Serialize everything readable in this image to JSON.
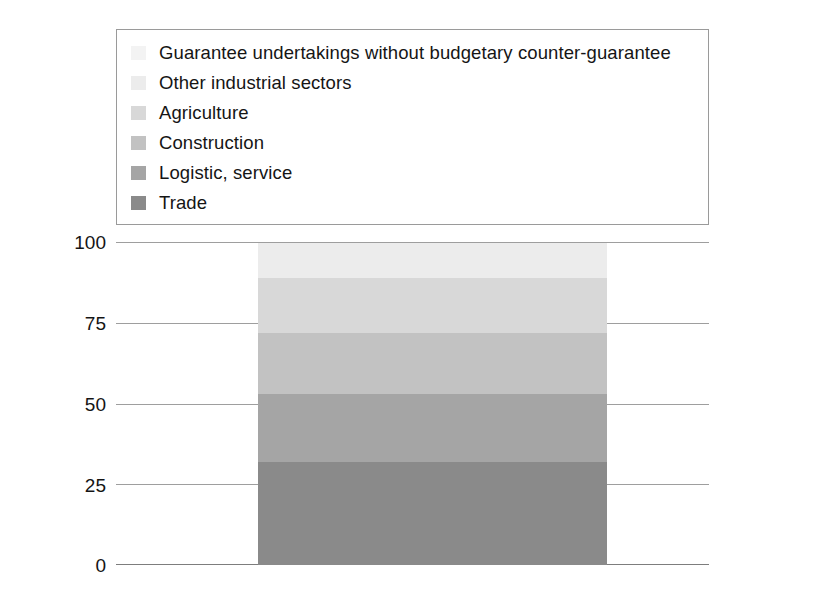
{
  "chart_data": {
    "type": "bar",
    "subtype": "stacked-column-100",
    "title": "",
    "xlabel": "",
    "ylabel": "",
    "ylim": [
      0,
      100
    ],
    "yticks": [
      "0",
      "25",
      "50",
      "75",
      "100"
    ],
    "ytick_values": [
      0,
      25,
      50,
      75,
      100
    ],
    "grid": true,
    "legend_position": "top",
    "categories": [
      ""
    ],
    "series": [
      {
        "name": "Trade",
        "values": [
          32
        ],
        "color": "#8a8a8a",
        "swatch_color": "#8a8a8a"
      },
      {
        "name": "Logistic, service",
        "values": [
          21
        ],
        "color": "#a5a5a5",
        "swatch_color": "#a5a5a5"
      },
      {
        "name": "Construction",
        "values": [
          19
        ],
        "color": "#c2c2c2",
        "swatch_color": "#c2c2c2"
      },
      {
        "name": "Agriculture",
        "values": [
          17
        ],
        "color": "#d8d8d8",
        "swatch_color": "#d8d8d8"
      },
      {
        "name": "Other industrial sectors",
        "values": [
          11
        ],
        "color": "#ececec",
        "swatch_color": "#ececec"
      },
      {
        "name": "Guarantee undertakings without budgetary counter-guarantee",
        "values": [
          0
        ],
        "color": "#f5f5f5",
        "swatch_color": "#f3f3f3"
      }
    ]
  },
  "legend": {
    "items": [
      {
        "label": "Guarantee undertakings without budgetary counter-guarantee",
        "color": "#f3f3f3"
      },
      {
        "label": "Other industrial sectors",
        "color": "#ececec"
      },
      {
        "label": "Agriculture",
        "color": "#d8d8d8"
      },
      {
        "label": "Construction",
        "color": "#c2c2c2"
      },
      {
        "label": "Logistic, service",
        "color": "#a5a5a5"
      },
      {
        "label": "Trade",
        "color": "#8a8a8a"
      }
    ]
  },
  "axis": {
    "y_ticks": [
      {
        "label": "100",
        "value": 100
      },
      {
        "label": "75",
        "value": 75
      },
      {
        "label": "50",
        "value": 50
      },
      {
        "label": "25",
        "value": 25
      },
      {
        "label": "0",
        "value": 0
      }
    ]
  },
  "style": {
    "gridline_color": "#9e9e9e",
    "legend_border_color": "#9a9a9a",
    "text_color": "#151515",
    "background": "#ffffff"
  }
}
